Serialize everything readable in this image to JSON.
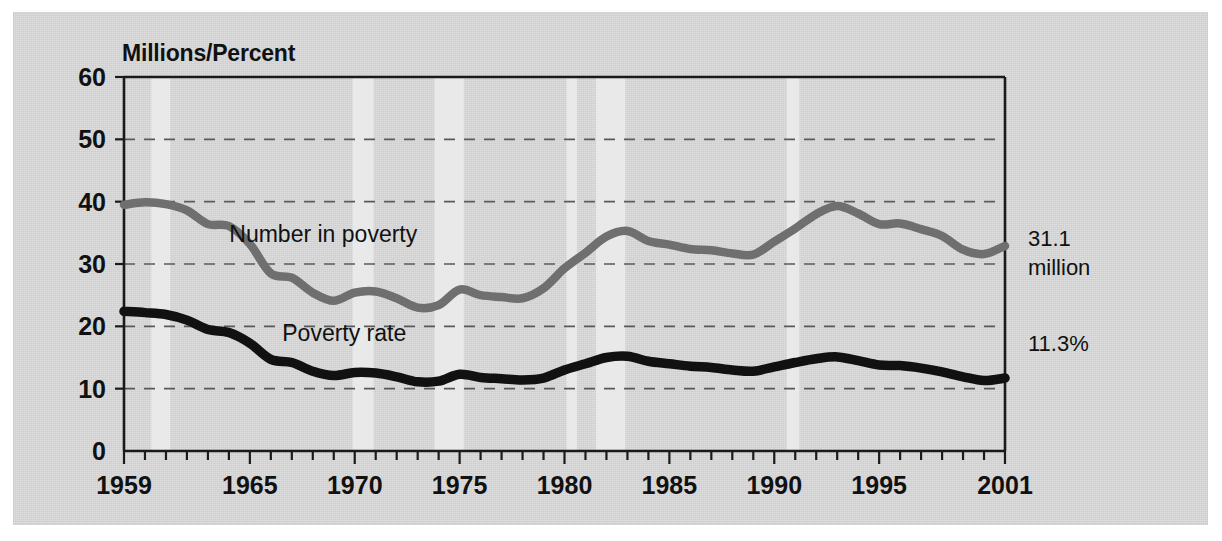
{
  "figure": {
    "axis_title": "Millions/Percent",
    "background_color": "#d5d5d5",
    "page_color": "#ffffff"
  },
  "annotations": {
    "number_value": "31.1",
    "number_unit": "million",
    "rate_value": "11.3%"
  },
  "chart_data": {
    "type": "line",
    "title": "",
    "subtitle": "",
    "xlabel": "",
    "ylabel": "Millions/Percent",
    "ylim": [
      0,
      60
    ],
    "xlim": [
      1959,
      2001
    ],
    "yticks": [
      0,
      10,
      20,
      30,
      40,
      50,
      60
    ],
    "ytick_labels": [
      "0",
      "10",
      "20",
      "30",
      "40",
      "50",
      "60"
    ],
    "xticks": [
      1959,
      1960,
      1961,
      1962,
      1963,
      1964,
      1965,
      1966,
      1967,
      1968,
      1969,
      1970,
      1971,
      1972,
      1973,
      1974,
      1975,
      1976,
      1977,
      1978,
      1979,
      1980,
      1981,
      1982,
      1983,
      1984,
      1985,
      1986,
      1987,
      1988,
      1989,
      1990,
      1991,
      1992,
      1993,
      1994,
      1995,
      1996,
      1997,
      1998,
      1999,
      2000,
      2001
    ],
    "xtick_labels_shown": [
      "1959",
      "1965",
      "1970",
      "1975",
      "1980",
      "1985",
      "1990",
      "1995",
      "2001"
    ],
    "xtick_labels_years": [
      1959,
      1965,
      1970,
      1975,
      1980,
      1985,
      1990,
      1995,
      2001
    ],
    "grid": "horizontal-dashed",
    "legend": "inline-labels",
    "x": [
      1959,
      1960,
      1961,
      1962,
      1963,
      1964,
      1965,
      1966,
      1967,
      1968,
      1969,
      1970,
      1971,
      1972,
      1973,
      1974,
      1975,
      1976,
      1977,
      1978,
      1979,
      1980,
      1981,
      1982,
      1983,
      1984,
      1985,
      1986,
      1987,
      1988,
      1989,
      1990,
      1991,
      1992,
      1993,
      1994,
      1995,
      1996,
      1997,
      1998,
      1999,
      2000,
      2001
    ],
    "series": [
      {
        "name": "Number in poverty",
        "unit": "millions",
        "color": "#6f6f6f",
        "label_x": 1968.5,
        "label_y": 33.5,
        "values": [
          39.5,
          39.9,
          39.6,
          38.6,
          36.4,
          36.1,
          33.2,
          28.5,
          27.8,
          25.4,
          24.1,
          25.4,
          25.6,
          24.5,
          23.0,
          23.4,
          25.9,
          25.0,
          24.7,
          24.5,
          26.1,
          29.3,
          31.8,
          34.4,
          35.3,
          33.7,
          33.1,
          32.4,
          32.2,
          31.7,
          31.5,
          33.6,
          35.7,
          38.0,
          39.3,
          38.1,
          36.4,
          36.5,
          35.6,
          34.5,
          32.3,
          31.6,
          32.9
        ]
      },
      {
        "name": "Poverty rate",
        "unit": "percent",
        "color": "#111111",
        "label_x": 1969.5,
        "label_y": 17.6,
        "values": [
          22.4,
          22.2,
          21.9,
          21.0,
          19.5,
          19.0,
          17.3,
          14.7,
          14.2,
          12.8,
          12.1,
          12.6,
          12.5,
          11.9,
          11.1,
          11.2,
          12.3,
          11.8,
          11.6,
          11.4,
          11.7,
          13.0,
          14.0,
          15.0,
          15.2,
          14.4,
          14.0,
          13.6,
          13.4,
          13.0,
          12.8,
          13.5,
          14.2,
          14.8,
          15.1,
          14.5,
          13.8,
          13.7,
          13.3,
          12.7,
          11.9,
          11.3,
          11.7
        ]
      }
    ],
    "recession_bands": [
      {
        "start": 1960.3,
        "end": 1961.2
      },
      {
        "start": 1969.9,
        "end": 1970.9
      },
      {
        "start": 1973.8,
        "end": 1975.2
      },
      {
        "start": 1980.1,
        "end": 1980.6
      },
      {
        "start": 1981.5,
        "end": 1982.9
      },
      {
        "start": 1990.6,
        "end": 1991.2
      }
    ]
  }
}
